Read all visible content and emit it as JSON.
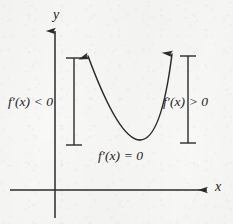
{
  "figure": {
    "kind": "calculus-derivative-sign-diagram",
    "background_color": "#f8f8f6",
    "ink_color": "#2b2b2b"
  },
  "axes": {
    "y_axis_label": "y",
    "x_axis_label": "x",
    "origin": {
      "x": 55,
      "y": 190
    },
    "y_axis": {
      "x": 55,
      "top": 28,
      "bottom": 218,
      "arrow_at": "top"
    },
    "x_axis": {
      "y": 190,
      "left": 10,
      "right": 210,
      "arrow_at": "right"
    }
  },
  "curve": {
    "name": "parabola",
    "description": "upward-opening parabola with arrowheads on both ends",
    "vertex": {
      "x": 140,
      "y": 140
    },
    "left_tip": {
      "x": 88,
      "y": 52
    },
    "right_tip": {
      "x": 172,
      "y": 50
    },
    "arrowheads": 2
  },
  "brackets": [
    {
      "name": "left-interval-bracket",
      "x": 74,
      "top": 58,
      "bottom": 145
    },
    {
      "name": "right-interval-bracket",
      "x": 188,
      "top": 56,
      "bottom": 143
    }
  ],
  "labels": {
    "left_region": "f′(x) < 0",
    "right_region": "f′(x) > 0",
    "vertex": "f′(x) = 0"
  }
}
